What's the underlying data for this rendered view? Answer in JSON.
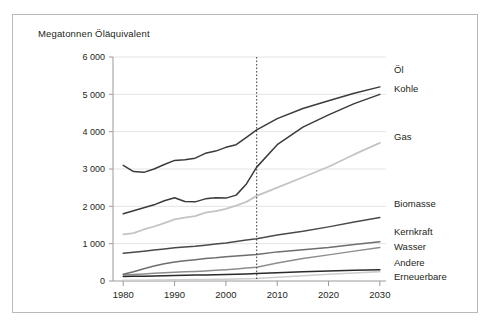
{
  "figure": {
    "axis_title": "Megatonnen Öläquivalent",
    "border_color": "#b9b9b9",
    "background": "#ffffff"
  },
  "axes": {
    "y_ticks": [
      "6 000",
      "5 000",
      "4 000",
      "3 000",
      "2 000",
      "1 000",
      "0"
    ],
    "x_ticks": [
      "1980",
      "1990",
      "2000",
      "2010",
      "2020",
      "2030"
    ]
  },
  "annotations": {
    "divider_year": 2006,
    "divider_label": ""
  },
  "legend": {
    "items": [
      {
        "label": "Öl"
      },
      {
        "label": "Kohle"
      },
      {
        "label": "Gas"
      },
      {
        "label": "Biomasse"
      },
      {
        "label": "Kernkraft"
      },
      {
        "label": "Wasser"
      },
      {
        "label": "Andere"
      },
      {
        "label": "Erneuerbare"
      }
    ]
  },
  "chart_data": {
    "type": "line",
    "title": "",
    "subtitle": "",
    "xlabel": "",
    "ylabel": "Megatonnen Öläquivalent",
    "xlim": [
      1978,
      2031
    ],
    "ylim": [
      0,
      6000
    ],
    "ytick_values": [
      0,
      1000,
      2000,
      3000,
      4000,
      5000,
      6000
    ],
    "xtick_values": [
      1980,
      1990,
      2000,
      2010,
      2020,
      2030
    ],
    "grid": "horizontal",
    "legend_position": "right-inline-labels",
    "annotations": [
      {
        "type": "vline",
        "x": 2006,
        "style": "dotted",
        "color": "#3b3b3b"
      }
    ],
    "x": [
      1980,
      1982,
      1984,
      1986,
      1988,
      1990,
      1992,
      1994,
      1996,
      1998,
      2000,
      2002,
      2004,
      2006,
      2010,
      2015,
      2020,
      2025,
      2030
    ],
    "series": [
      {
        "name": "Öl",
        "color": "#3b3b3b",
        "width": 1.5,
        "values": [
          3100,
          2930,
          2910,
          3000,
          3120,
          3230,
          3250,
          3290,
          3420,
          3480,
          3580,
          3650,
          3850,
          4050,
          4350,
          4620,
          4830,
          5030,
          5200
        ]
      },
      {
        "name": "Kohle",
        "color": "#3b3b3b",
        "width": 1.5,
        "values": [
          1800,
          1880,
          1960,
          2040,
          2150,
          2230,
          2130,
          2120,
          2200,
          2230,
          2220,
          2300,
          2600,
          3050,
          3650,
          4120,
          4450,
          4750,
          5000
        ]
      },
      {
        "name": "Gas",
        "color": "#c4c4c4",
        "width": 1.8,
        "values": [
          1250,
          1280,
          1380,
          1460,
          1550,
          1650,
          1700,
          1740,
          1830,
          1870,
          1930,
          2020,
          2120,
          2280,
          2500,
          2780,
          3060,
          3390,
          3700
        ]
      },
      {
        "name": "Biomasse",
        "color": "#4a4a4a",
        "width": 1.5,
        "values": [
          740,
          770,
          800,
          830,
          860,
          890,
          910,
          930,
          960,
          990,
          1020,
          1060,
          1100,
          1130,
          1230,
          1330,
          1450,
          1580,
          1700
        ]
      },
      {
        "name": "Kernkraft",
        "color": "#6e6e6e",
        "width": 1.5,
        "values": [
          180,
          250,
          330,
          400,
          460,
          510,
          540,
          570,
          600,
          620,
          650,
          670,
          690,
          710,
          780,
          840,
          900,
          980,
          1050
        ]
      },
      {
        "name": "Wasser",
        "color": "#8d8d8d",
        "width": 1.5,
        "values": [
          160,
          175,
          190,
          205,
          220,
          235,
          245,
          255,
          270,
          285,
          300,
          320,
          345,
          370,
          480,
          600,
          700,
          800,
          900
        ]
      },
      {
        "name": "Andere",
        "color": "#2a2a2a",
        "width": 1.5,
        "values": [
          120,
          125,
          130,
          135,
          140,
          148,
          152,
          158,
          163,
          168,
          175,
          182,
          190,
          198,
          220,
          245,
          265,
          285,
          300
        ]
      },
      {
        "name": "Erneuerbare",
        "color": "#cdcdcd",
        "width": 1.6,
        "values": [
          18,
          20,
          22,
          25,
          28,
          30,
          33,
          36,
          40,
          44,
          48,
          54,
          60,
          68,
          100,
          140,
          180,
          215,
          250
        ]
      }
    ]
  }
}
